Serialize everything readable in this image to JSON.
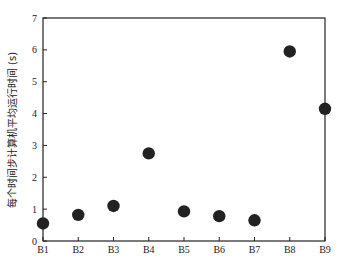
{
  "chart_data": {
    "type": "scatter",
    "title": "",
    "xlabel": "",
    "ylabel": "每个时间步计算机平均运行时间 (s)",
    "categories": [
      "B1",
      "B2",
      "B3",
      "B4",
      "B5",
      "B6",
      "B7",
      "B8",
      "B9"
    ],
    "values": [
      0.55,
      0.82,
      1.1,
      2.75,
      0.93,
      0.78,
      0.65,
      5.95,
      4.15
    ],
    "ylim": [
      0,
      7
    ],
    "yticks": [
      0,
      1,
      2,
      3,
      4,
      5,
      6,
      7
    ],
    "grid": false,
    "legend": null,
    "marker_color": "#222222"
  }
}
